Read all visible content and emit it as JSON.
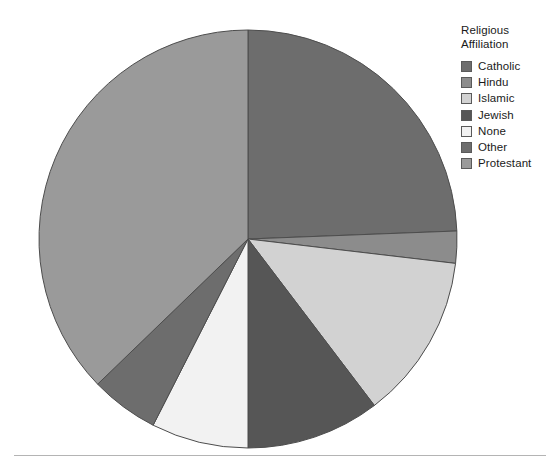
{
  "chart_data": {
    "type": "pie",
    "title": "",
    "legend_title": "Religious\nAffiliation",
    "legend_position": "right",
    "start_angle_deg": 0,
    "direction": "clockwise",
    "categories": [
      "Catholic",
      "Hindu",
      "Islamic",
      "Jewish",
      "None",
      "Other",
      "Protestant"
    ],
    "values": [
      24.4,
      2.5,
      12.8,
      10.3,
      7.5,
      5.3,
      37.2
    ],
    "units": "percent",
    "slices": [
      {
        "label": "Catholic",
        "value": 24.4,
        "start_deg": 0.0,
        "end_deg": 87.8,
        "color": "#6d6d6d"
      },
      {
        "label": "Hindu",
        "value": 2.5,
        "start_deg": 87.8,
        "end_deg": 96.7,
        "color": "#8c8c8c"
      },
      {
        "label": "Islamic",
        "value": 12.8,
        "start_deg": 96.7,
        "end_deg": 142.8,
        "color": "#d2d2d2"
      },
      {
        "label": "Jewish",
        "value": 10.3,
        "start_deg": 142.8,
        "end_deg": 180.0,
        "color": "#565656"
      },
      {
        "label": "None",
        "value": 7.5,
        "start_deg": 180.0,
        "end_deg": 207.0,
        "color": "#f2f2f2"
      },
      {
        "label": "Other",
        "value": 5.3,
        "start_deg": 207.0,
        "end_deg": 226.0,
        "color": "#6d6d6d"
      },
      {
        "label": "Protestant",
        "value": 37.2,
        "start_deg": 226.0,
        "end_deg": 360.0,
        "color": "#9a9a9a"
      }
    ],
    "geometry": {
      "center_x": 248,
      "center_y": 239,
      "radius": 209
    },
    "stroke_color": "#4d4d4d",
    "background_color": "#ffffff"
  },
  "legend": {
    "title": "Religious\nAffiliation",
    "items": [
      {
        "label": "Catholic",
        "color": "#6d6d6d"
      },
      {
        "label": "Hindu",
        "color": "#8c8c8c"
      },
      {
        "label": "Islamic",
        "color": "#d2d2d2"
      },
      {
        "label": "Jewish",
        "color": "#565656"
      },
      {
        "label": "None",
        "color": "#f2f2f2"
      },
      {
        "label": "Other",
        "color": "#6d6d6d"
      },
      {
        "label": "Protestant",
        "color": "#9a9a9a"
      }
    ]
  },
  "footer": {
    "rule_color": "#b4b4b4"
  }
}
